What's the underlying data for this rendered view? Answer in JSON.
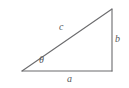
{
  "diagram": {
    "type": "right-triangle",
    "background_color": "#ffffff",
    "stroke_color": "#6b6b6d",
    "label_color": "#59595b",
    "vertices": {
      "left": {
        "x": 22,
        "y": 71
      },
      "apex": {
        "x": 112,
        "y": 9
      },
      "corner": {
        "x": 112,
        "y": 71
      }
    },
    "labels": {
      "hypotenuse": "c",
      "opposite": "b",
      "adjacent": "a",
      "angle": "θ"
    }
  }
}
